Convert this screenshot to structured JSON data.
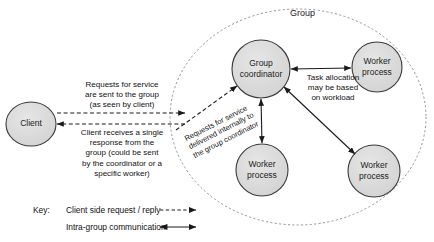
{
  "diagram": {
    "title": "Group",
    "nodes": {
      "client": {
        "label": "Client"
      },
      "coordinator": {
        "label": "Group\ncoordinator"
      },
      "worker_top_right": {
        "label": "Worker\nprocess"
      },
      "worker_bottom_left": {
        "label": "Worker\nprocess"
      },
      "worker_bottom_right": {
        "label": "Worker\nprocess"
      }
    },
    "annotations": {
      "request_to_group": "Requests for service\nare sent to the group\n(as seen by client)",
      "single_response": "Client receives a single\nresponse from the\ngroup (could be sent\nby the coordinator or a\nspecific worker)",
      "internal_delivery": "Requests for service\ndelivered internally to\nthe group coordinator",
      "task_allocation": "Task allocation\nmay be based\non workload"
    },
    "key": {
      "title": "Key:",
      "items": [
        {
          "label": "Client side request / reply",
          "style": "dashed-single-arrow"
        },
        {
          "label": "Intra-group communication",
          "style": "solid-double-arrow"
        }
      ]
    },
    "colors": {
      "node_fill": "#d9d9d9",
      "node_stroke": "#3a3a3a",
      "group_stroke": "#777777",
      "arrow": "#1a1a1a",
      "text": "#111111"
    }
  }
}
